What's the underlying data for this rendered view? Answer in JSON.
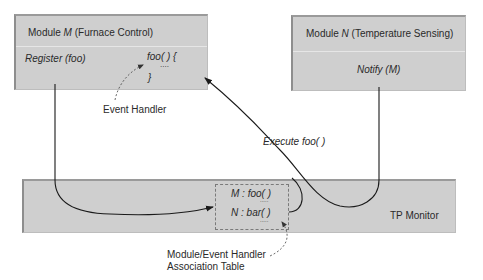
{
  "modules": {
    "m": {
      "title_prefix": "Module ",
      "title_var": "M",
      "title_suffix": " (Furnace Control)",
      "register_call": "Register (foo)",
      "handler_open": "foo( ) {",
      "handler_body": "....",
      "handler_close": "}"
    },
    "n": {
      "title_prefix": "Module ",
      "title_var": "N",
      "title_suffix": " (Temperature Sensing)",
      "notify_call": "Notify (M)"
    }
  },
  "tp_monitor": {
    "label": "TP Monitor",
    "table": {
      "rows": [
        {
          "module": "M",
          "sep": " :  ",
          "handler": "foo( )"
        },
        {
          "module": "N",
          "sep": " :  ",
          "handler": "bar( )"
        }
      ],
      "ellipsis": "....."
    }
  },
  "annotations": {
    "event_handler": "Event Handler",
    "execute": "Execute foo( )",
    "table_caption_line1": "Module/Event Handler",
    "table_caption_line2": "Association Table"
  },
  "colors": {
    "box_fill": "#cfcfcf",
    "line": "#1a1a1a",
    "text": "#2a2a2a"
  }
}
